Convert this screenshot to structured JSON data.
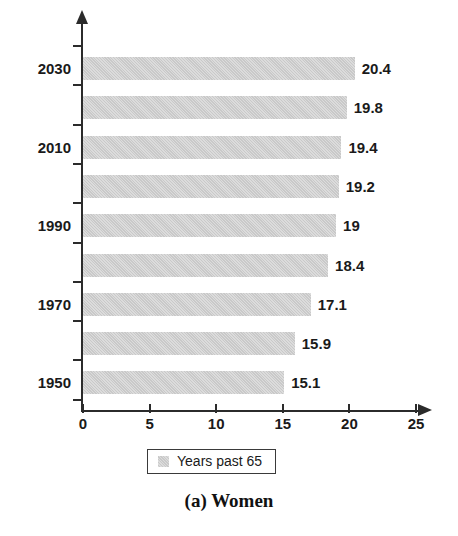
{
  "caption": "(a) Women",
  "legend": {
    "label": "Years past 65",
    "swatch_color": "#c9c9c9"
  },
  "axis": {
    "x_ticks": [
      "0",
      "5",
      "10",
      "15",
      "20",
      "25"
    ],
    "y_ticks": [
      "2030",
      "2010",
      "1990",
      "1970",
      "1950"
    ]
  },
  "chart_data": {
    "type": "bar",
    "orientation": "horizontal",
    "title": "(a) Women",
    "xlabel": "",
    "ylabel": "",
    "xlim": [
      0,
      25
    ],
    "xticks": [
      0,
      5,
      10,
      15,
      20,
      25
    ],
    "grid": false,
    "legend_position": "bottom",
    "series": [
      {
        "name": "Years past 65",
        "color": "#c9c9c9",
        "values": [
          20.4,
          19.8,
          19.4,
          19.2,
          19,
          18.4,
          17.1,
          15.9,
          15.1
        ]
      }
    ],
    "categories": [
      "2030",
      "2020",
      "2010",
      "2000",
      "1990",
      "1980",
      "1970",
      "1960",
      "1950"
    ],
    "category_labels_shown": [
      "2030",
      "",
      "2010",
      "",
      "1990",
      "",
      "1970",
      "",
      "1950"
    ],
    "value_labels": [
      "20.4",
      "19.8",
      "19.4",
      "19.2",
      "19",
      "18.4",
      "17.1",
      "15.9",
      "15.1"
    ]
  }
}
